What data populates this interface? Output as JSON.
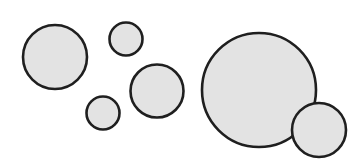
{
  "diagram": {
    "type": "circles",
    "width": 361,
    "height": 161,
    "fill_color": "#e3e3e3",
    "stroke_color": "#1f1f1f",
    "circles": [
      {
        "id": "circle-1",
        "cx": 55,
        "cy": 57,
        "r": 32
      },
      {
        "id": "circle-2",
        "cx": 126,
        "cy": 39,
        "r": 16.5
      },
      {
        "id": "circle-3",
        "cx": 157,
        "cy": 91,
        "r": 26.5
      },
      {
        "id": "circle-4",
        "cx": 103,
        "cy": 113,
        "r": 16.5
      },
      {
        "id": "circle-5",
        "cx": 259,
        "cy": 90,
        "r": 57
      },
      {
        "id": "circle-6",
        "cx": 319,
        "cy": 130,
        "r": 27
      }
    ]
  }
}
